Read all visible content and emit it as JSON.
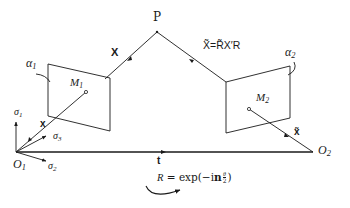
{
  "diagram": {
    "colors": {
      "stroke": "#1a1a1a",
      "background": "#ffffff"
    },
    "point_P": {
      "label": "P"
    },
    "ray_left": {
      "label": "X"
    },
    "ray_right": {
      "label_lhs": "X̃",
      "label_eq": "=",
      "label_rhs": "R̃X′R"
    },
    "plane_left": {
      "label_alpha": "α",
      "alpha_sub": "1",
      "label_M": "M",
      "M_sub": "1"
    },
    "plane_right": {
      "label_alpha": "α",
      "alpha_sub": "2",
      "label_M": "M",
      "M_sub": "2"
    },
    "image_vector_left": {
      "label": "x"
    },
    "image_vector_right": {
      "label": "x̃"
    },
    "origin_left": {
      "label": "O",
      "sub": "1"
    },
    "origin_right": {
      "label": "O",
      "sub": "2"
    },
    "frame_axes": [
      {
        "label": "σ",
        "sub": "1"
      },
      {
        "label": "σ",
        "sub": "2"
      },
      {
        "label": "σ",
        "sub": "3"
      }
    ],
    "baseline": {
      "label": "t"
    },
    "rotation": {
      "lhs": "R",
      "eq": " = exp(−i",
      "n": "n",
      "frac_num": "θ",
      "frac_den": "2",
      "close": ")"
    }
  }
}
